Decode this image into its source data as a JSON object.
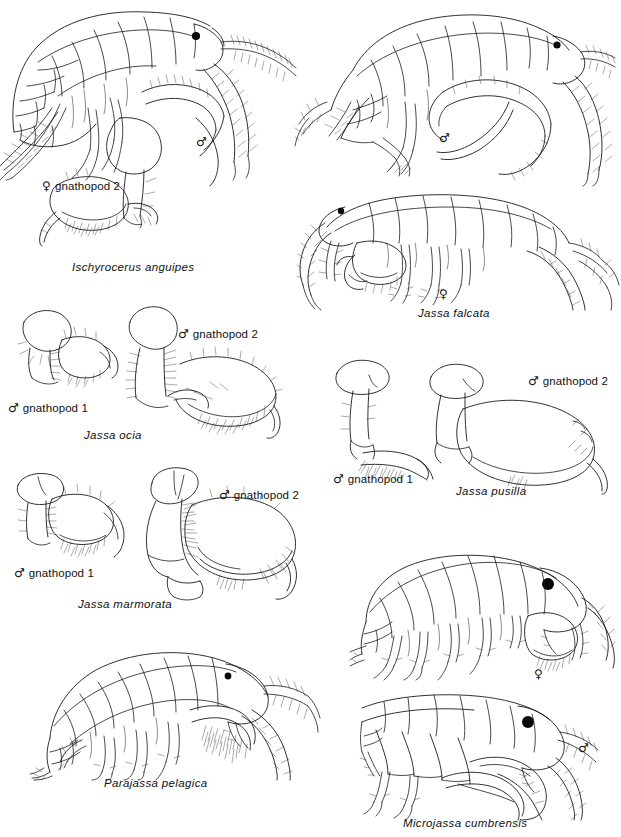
{
  "plate": {
    "title": "Amphipod identification plate — Ischyroceridae",
    "background_color": "#ffffff",
    "ink_color": "#1a1a1a",
    "width": 621,
    "height": 837,
    "symbols": {
      "male": "♂",
      "female": "♀"
    }
  },
  "panels": [
    {
      "id": "ischyrocerus-anguipes",
      "species": "Ischyrocerus anguipes",
      "figures": [
        {
          "name": "whole-animal-male",
          "sex": "♂",
          "view": "lateral habitus"
        },
        {
          "name": "gnathopod-2-female",
          "sex": "♀",
          "view": "appendage"
        }
      ],
      "labels": [
        {
          "sex": "♀",
          "text": "gnathopod 2"
        }
      ]
    },
    {
      "id": "jassa-falcata",
      "species": "Jassa falcata",
      "figures": [
        {
          "name": "whole-animal-male",
          "sex": "♂",
          "view": "lateral habitus"
        },
        {
          "name": "whole-animal-female",
          "sex": "♀",
          "view": "lateral habitus"
        }
      ],
      "labels": []
    },
    {
      "id": "jassa-ocia",
      "species": "Jassa ocia",
      "figures": [
        {
          "name": "gnathopod-1-male",
          "sex": "♂",
          "view": "appendage"
        },
        {
          "name": "gnathopod-2-male",
          "sex": "♂",
          "view": "appendage"
        }
      ],
      "labels": [
        {
          "sex": "♂",
          "text": "gnathopod 1"
        },
        {
          "sex": "♂",
          "text": "gnathopod 2"
        }
      ]
    },
    {
      "id": "jassa-pusilla",
      "species": "Jassa pusilla",
      "figures": [
        {
          "name": "gnathopod-1-male",
          "sex": "♂",
          "view": "appendage"
        },
        {
          "name": "gnathopod-2-male",
          "sex": "♂",
          "view": "appendage"
        }
      ],
      "labels": [
        {
          "sex": "♂",
          "text": "gnathopod 1"
        },
        {
          "sex": "♂",
          "text": "gnathopod 2"
        }
      ]
    },
    {
      "id": "jassa-marmorata",
      "species": "Jassa marmorata",
      "figures": [
        {
          "name": "gnathopod-1-male",
          "sex": "♂",
          "view": "appendage"
        },
        {
          "name": "gnathopod-2-male",
          "sex": "♂",
          "view": "appendage"
        }
      ],
      "labels": [
        {
          "sex": "♂",
          "text": "gnathopod 1"
        },
        {
          "sex": "♂",
          "text": "gnathopod 2"
        }
      ]
    },
    {
      "id": "parajassa-pelagica",
      "species": "Parajassa pelagica",
      "figures": [
        {
          "name": "whole-animal",
          "sex": "",
          "view": "lateral habitus"
        }
      ],
      "labels": []
    },
    {
      "id": "microjassa-cumbrensis",
      "species": "Microjassa cumbrensis",
      "figures": [
        {
          "name": "whole-animal-female",
          "sex": "♀",
          "view": "lateral habitus"
        },
        {
          "name": "whole-animal-male",
          "sex": "♂",
          "view": "lateral habitus"
        }
      ],
      "labels": []
    }
  ],
  "text": {
    "ischyrocerus_species": "Ischyrocerus anguipes",
    "ischyrocerus_gnath2_label": "gnathopod 2",
    "ischyrocerus_male_sym": "♂",
    "ischyrocerus_female_sym": "♀",
    "falcata_species": "Jassa falcata",
    "falcata_male_sym": "♂",
    "falcata_female_sym": "♀",
    "ocia_species": "Jassa ocia",
    "ocia_gnath1_label": "gnathopod 1",
    "ocia_gnath2_label": "gnathopod 2",
    "ocia_gnath1_sym": "♂",
    "ocia_gnath2_sym": "♂",
    "pusilla_species": "Jassa pusilla",
    "pusilla_gnath1_label": "gnathopod 1",
    "pusilla_gnath2_label": "gnathopod 2",
    "pusilla_gnath1_sym": "♂",
    "pusilla_gnath2_sym": "♂",
    "marmorata_species": "Jassa marmorata",
    "marmorata_gnath1_label": "gnathopod 1",
    "marmorata_gnath2_label": "gnathopod 2",
    "marmorata_gnath1_sym": "♂",
    "marmorata_gnath2_sym": "♂",
    "parajassa_species": "Parajassa pelagica",
    "microjassa_species": "Microjassa cumbrensis",
    "microjassa_female_sym": "♀",
    "microjassa_male_sym": "♂"
  }
}
